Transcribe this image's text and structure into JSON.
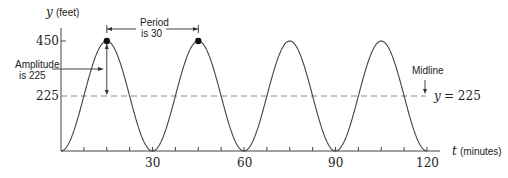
{
  "chart_data": {
    "type": "line",
    "title": "",
    "xlabel_var": "t",
    "xlabel_unit": "(minutes)",
    "ylabel_var": "y",
    "ylabel_unit": "(feet)",
    "x_ticks": [
      30,
      60,
      90,
      120
    ],
    "x_tick_labels": [
      "30",
      "60",
      "90",
      "120"
    ],
    "y_ticks": [
      225,
      450
    ],
    "y_tick_labels": [
      "225",
      "450"
    ],
    "xlim": [
      0,
      125
    ],
    "ylim": [
      0,
      480
    ],
    "grid": false,
    "function": "y = 225 - 225*cos(2*pi*t/30)",
    "series": [
      {
        "name": "height",
        "x": [
          0,
          7.5,
          15,
          22.5,
          30,
          37.5,
          45,
          52.5,
          60,
          67.5,
          75,
          82.5,
          90,
          97.5,
          105,
          112.5,
          120
        ],
        "values": [
          0,
          225,
          450,
          225,
          0,
          225,
          450,
          225,
          0,
          225,
          450,
          225,
          0,
          225,
          450,
          225,
          0
        ]
      }
    ],
    "highlighted_points": [
      {
        "x": 15,
        "y": 450
      },
      {
        "x": 45,
        "y": 450
      }
    ],
    "midline": {
      "y": 225,
      "label": "Midline",
      "equation": "y = 225"
    },
    "annotations": {
      "period_line1": "Period",
      "period_line2": "is 30",
      "amplitude_line1": "Amplitude",
      "amplitude_line2": "is 225",
      "midline_label": "Midline",
      "midline_eq_lhs": "y",
      "midline_eq_rhs": "= 225"
    }
  }
}
